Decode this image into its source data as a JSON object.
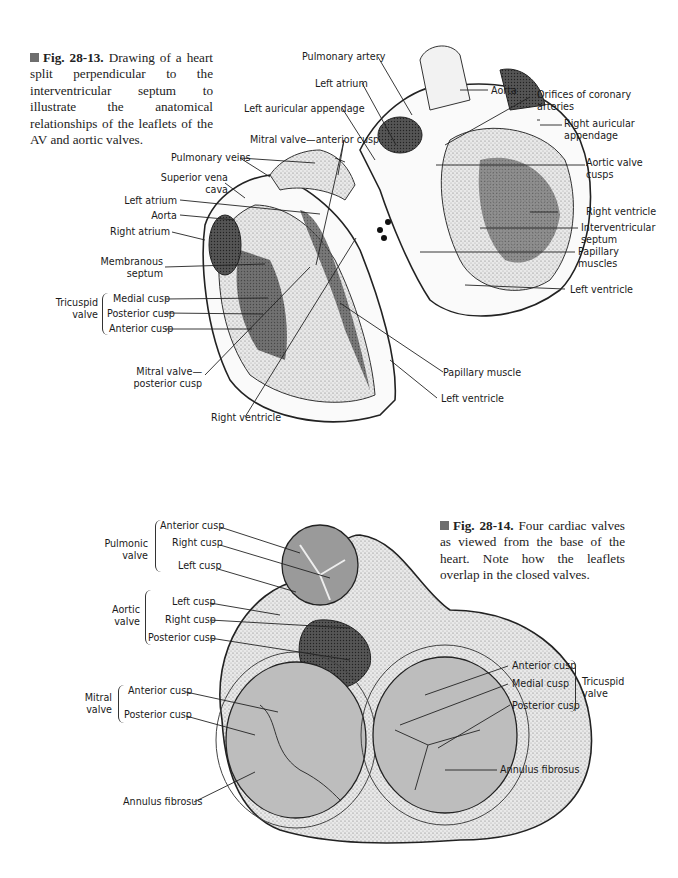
{
  "figure_1": {
    "number": "Fig. 28-13.",
    "caption": "Drawing of a heart split perpendicular to the interventricular septum to illustrate the anatomical relationships of the leaflets of the AV and aortic valves.",
    "labels": {
      "pulmonary_artery": "Pulmonary artery",
      "left_atrium_top": "Left atrium",
      "aorta_top": "Aorta",
      "orifices_coronary": "Orifices of coronary arteries",
      "left_auricular_appendage": "Left auricular appendage",
      "right_auricular_appendage": "Right auricular appendage",
      "mitral_anterior_cusp": "Mitral valve—anterior cusp",
      "pulmonary_veins": "Pulmonary veins",
      "aortic_valve_cusps": "Aortic valve cusps",
      "superior_vena_cava": "Superior vena cava",
      "left_atrium": "Left atrium",
      "aorta": "Aorta",
      "right_atrium": "Right atrium",
      "membranous_septum": "Membranous septum",
      "tricuspid_valve": "Tricuspid valve",
      "medial_cusp": "Medial cusp",
      "posterior_cusp": "Posterior cusp",
      "anterior_cusp": "Anterior cusp",
      "mitral_posterior_cusp": "Mitral valve— posterior cusp",
      "right_ventricle_bottom": "Right ventricle",
      "right_ventricle": "Right ventricle",
      "interventricular_septum": "Interventricular septum",
      "papillary_muscles": "Papillary muscles",
      "left_ventricle_right": "Left ventricle",
      "papillary_muscle": "Papillary muscle",
      "left_ventricle_bottom": "Left ventricle"
    }
  },
  "figure_2": {
    "number": "Fig. 28-14.",
    "caption": "Four cardiac valves as viewed from the base of the heart. Note how the leaflets overlap in the closed valves.",
    "labels": {
      "pulmonic_valve": "Pulmonic valve",
      "pulm_anterior_cusp": "Anterior cusp",
      "pulm_right_cusp": "Right cusp",
      "pulm_left_cusp": "Left cusp",
      "aortic_valve": "Aortic valve",
      "aortic_left_cusp": "Left cusp",
      "aortic_right_cusp": "Right cusp",
      "aortic_posterior_cusp": "Posterior cusp",
      "mitral_valve": "Mitral valve",
      "mitral_anterior_cusp": "Anterior cusp",
      "mitral_posterior_cusp": "Posterior cusp",
      "annulus_left": "Annulus fibrosus",
      "tricuspid_valve": "Tricuspid valve",
      "tri_anterior_cusp": "Anterior cusp",
      "tri_medial_cusp": "Medial cusp",
      "tri_posterior_cusp": "Posterior cusp",
      "annulus_right": "Annulus fibrosus"
    }
  }
}
